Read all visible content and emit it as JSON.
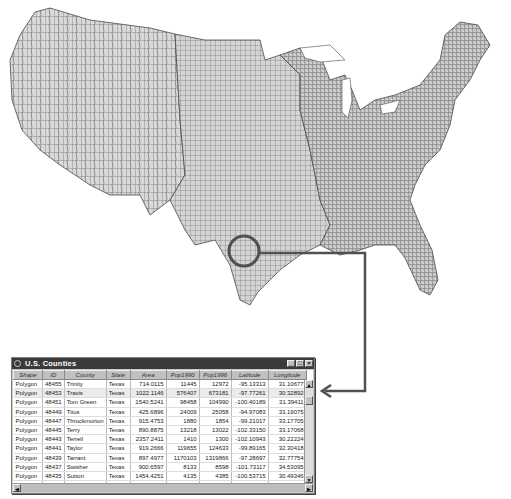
{
  "map": {
    "title": "U.S. counties map",
    "fill_color": "#d9d9d9",
    "border_color": "#4a4a4a",
    "highlight": {
      "shape": "circle",
      "region": "Central Texas",
      "color": "#555555"
    }
  },
  "table_window": {
    "title": "U.S. Counties",
    "controls": {
      "minimize": "_",
      "maximize": "□",
      "close": "×"
    },
    "columns": [
      "Shape",
      "ID",
      "County",
      "State",
      "Area",
      "Pop1990",
      "Pop1996",
      "Latitude",
      "Longitude"
    ],
    "rows": [
      [
        "Polygon",
        "48455",
        "Trinity",
        "Texas",
        "714.0115",
        "11445",
        "12972",
        "-95.13313",
        "31.10677"
      ],
      [
        "Polygon",
        "48453",
        "Travis",
        "Texas",
        "1022.1146",
        "576407",
        "673181",
        "-97.77261",
        "30.32892"
      ],
      [
        "Polygon",
        "48451",
        "Tom Green",
        "Texas",
        "1540.5241",
        "98458",
        "104990",
        "-100.40189",
        "31.39411"
      ],
      [
        "Polygon",
        "48449",
        "Titus",
        "Texas",
        "425.6896",
        "24009",
        "25058",
        "-94.97083",
        "33.19075"
      ],
      [
        "Polygon",
        "48447",
        "Throckmorton",
        "Texas",
        "915.4753",
        "1880",
        "1854",
        "-99.21017",
        "33.17705"
      ],
      [
        "Polygon",
        "48445",
        "Terry",
        "Texas",
        "890.8875",
        "13218",
        "13022",
        "-102.33150",
        "33.17068"
      ],
      [
        "Polygon",
        "48443",
        "Terrell",
        "Texas",
        "2357.2411",
        "1410",
        "1300",
        "-102.10943",
        "30.22224"
      ],
      [
        "Polygon",
        "48441",
        "Taylor",
        "Texas",
        "919.2666",
        "119655",
        "124633",
        "-99.89165",
        "32.30418"
      ],
      [
        "Polygon",
        "48439",
        "Tarrant",
        "Texas",
        "897.4977",
        "1170103",
        "1319866",
        "-97.28697",
        "32.77754"
      ],
      [
        "Polygon",
        "48437",
        "Swisher",
        "Texas",
        "900.6597",
        "8133",
        "8598",
        "-101.73117",
        "34.53095"
      ],
      [
        "Polygon",
        "48435",
        "Sutton",
        "Texas",
        "1454.4251",
        "4135",
        "4385",
        "-100.53715",
        "30.49346"
      ],
      [
        "Polygon",
        "48433",
        "Stonewall",
        "Texas",
        "920.2280",
        "2013",
        "1974",
        "-100.25528",
        "33.17836"
      ],
      [
        "Polygon",
        "48431",
        "Sterling",
        "Texas",
        "923.5035",
        "1438",
        "1595",
        "-101.04306",
        "31.82945"
      ]
    ],
    "selected_row": 1,
    "scroll": {
      "up": "▲",
      "down": "▼",
      "left": "◀",
      "right": "▶"
    }
  }
}
